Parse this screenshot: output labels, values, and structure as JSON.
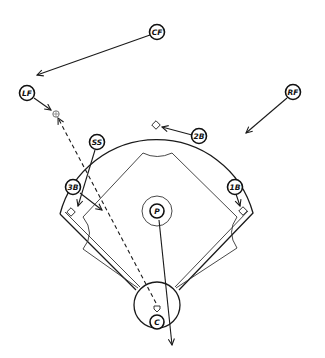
{
  "diagram": {
    "positions": [
      {
        "id": "cf",
        "label": "CF",
        "name": "Center Fielder"
      },
      {
        "id": "lf",
        "label": "LF",
        "name": "Left Fielder"
      },
      {
        "id": "rf",
        "label": "RF",
        "name": "Right Fielder"
      },
      {
        "id": "ss",
        "label": "SS",
        "name": "Shortstop"
      },
      {
        "id": "2b",
        "label": "2B",
        "name": "Second Baseman"
      },
      {
        "id": "3b",
        "label": "3B",
        "name": "Third Baseman"
      },
      {
        "id": "1b",
        "label": "1B",
        "name": "First Baseman"
      },
      {
        "id": "p",
        "label": "P",
        "name": "Pitcher"
      },
      {
        "id": "c",
        "label": "C",
        "name": "Catcher"
      }
    ],
    "movements": [
      {
        "from": "CF",
        "to": "behind LF",
        "style": "solid"
      },
      {
        "from": "LF",
        "to": "ball landing spot",
        "style": "solid"
      },
      {
        "from": "RF",
        "to": "toward infield",
        "style": "solid"
      },
      {
        "from": "2B",
        "to": "second base",
        "style": "solid"
      },
      {
        "from": "SS",
        "to": "third base",
        "style": "solid"
      },
      {
        "from": "3B",
        "to": "toward home-side infield",
        "style": "solid"
      },
      {
        "from": "1B",
        "to": "first base",
        "style": "solid"
      },
      {
        "from": "P",
        "to": "behind home plate",
        "style": "solid"
      },
      {
        "from": "home plate",
        "to": "ball landing spot in left field",
        "style": "dashed"
      }
    ],
    "colors": {
      "ink": "#1a1a1a",
      "background": "#ffffff"
    }
  }
}
